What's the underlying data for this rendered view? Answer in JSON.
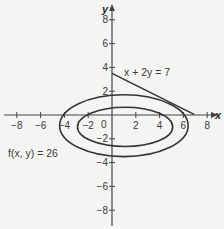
{
  "figure": {
    "axes": {
      "x_label": "x",
      "y_label": "y",
      "x_range": [
        -8,
        8
      ],
      "y_range": [
        -8,
        8
      ],
      "x_ticks": [
        {
          "value": -8,
          "label": "−8"
        },
        {
          "value": -6,
          "label": "−6"
        },
        {
          "value": -4,
          "label": "−4"
        },
        {
          "value": -2,
          "label": "−2"
        },
        {
          "value": 2,
          "label": "2"
        },
        {
          "value": 4,
          "label": "4"
        },
        {
          "value": 6,
          "label": "6"
        },
        {
          "value": 8,
          "label": "8"
        }
      ],
      "y_ticks": [
        {
          "value": 8,
          "label": "8"
        },
        {
          "value": 6,
          "label": "6"
        },
        {
          "value": 4,
          "label": "4"
        },
        {
          "value": 2,
          "label": "2"
        },
        {
          "value": -2,
          "label": "−2"
        },
        {
          "value": -4,
          "label": "−4"
        },
        {
          "value": -6,
          "label": "−6"
        },
        {
          "value": -8,
          "label": "−8"
        }
      ],
      "origin_label": "0"
    },
    "curves": {
      "outer_ellipse": {
        "center": [
          1,
          -0.9
        ],
        "semi_axes": [
          5.4,
          2.6
        ],
        "label": "f(x, y) = 26"
      },
      "inner_ellipse": {
        "center": [
          1.1,
          -1.0
        ],
        "semi_axes": [
          4.0,
          1.65
        ]
      },
      "constraint_line": {
        "equation": "x + 2y = 7",
        "from": [
          0,
          3.5
        ],
        "to": [
          6.9,
          0.05
        ]
      }
    },
    "colors": {
      "stroke": "#333333",
      "axis": "#444444",
      "background": "#f4f4f2"
    }
  }
}
